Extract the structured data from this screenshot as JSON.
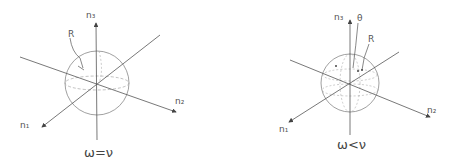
{
  "figures": [
    {
      "caption": "ω=ν",
      "labels": {
        "n1": "n₁",
        "n2": "n₂",
        "n3": "n₃",
        "R": "R"
      }
    },
    {
      "caption": "ω<ν",
      "labels": {
        "n1": "n₁",
        "n2": "n₂",
        "n3": "n₃",
        "theta": "θ",
        "R": "R"
      }
    }
  ],
  "colors": {
    "line": "#555555",
    "text": "#444444"
  }
}
